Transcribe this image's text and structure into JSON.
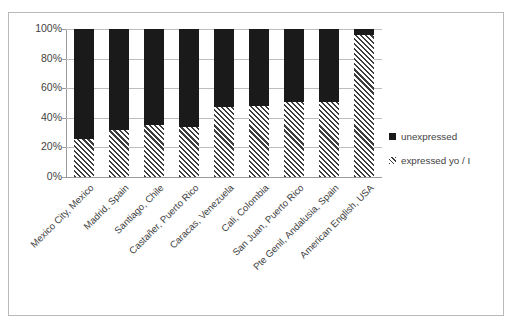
{
  "chart_data": {
    "type": "bar",
    "subtype": "stacked-percentage",
    "title": "",
    "subtitle": "",
    "xlabel": "",
    "ylabel": "",
    "ylim": [
      0,
      100
    ],
    "ytick_labels": [
      "100%",
      "80%",
      "60%",
      "40%",
      "20%",
      "0%"
    ],
    "ytick_values": [
      100,
      80,
      60,
      40,
      20,
      0
    ],
    "grid": true,
    "legend_position": "right",
    "categories": [
      "Mexico City, Mexico",
      "Madrid, Spain",
      "Santiago, Chile",
      "Castañer, Puerto Rico",
      "Caracas, Venezuela",
      "Cali, Colombia",
      "San Juan, Puerto Rico",
      "Pte Genil, Andalusia, Spain",
      "American English, USA"
    ],
    "series": [
      {
        "name": "unexpressed",
        "color": "#1a1a1a",
        "values": [
          74,
          68,
          65,
          66,
          53,
          52,
          49,
          49,
          4
        ]
      },
      {
        "name": "expressed  yo / I",
        "color": "#3d3d3d",
        "pattern": "diagonal-hatch",
        "values": [
          26,
          32,
          35,
          34,
          47,
          48,
          51,
          51,
          96
        ]
      }
    ]
  },
  "legend": {
    "items": [
      {
        "label": "unexpressed",
        "swatch": "solid-black-square-icon"
      },
      {
        "label": "expressed  yo / I",
        "swatch": "hatched-square-icon"
      }
    ]
  }
}
